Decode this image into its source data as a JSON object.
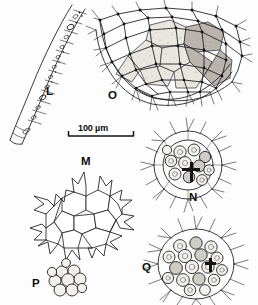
{
  "plate": {
    "title": "Microalgae plate",
    "background_color": "#fdfdfd",
    "ink_color": "#1a1a1a",
    "width": 258,
    "height": 305
  },
  "scale_bar": {
    "label": "100 µm",
    "value": 100,
    "unit": "µm",
    "x": 68,
    "y": 136,
    "length_px": 66
  },
  "figures": [
    {
      "id": "L",
      "label": "L",
      "kind": "filament",
      "description": "curved multicellular filament with segmented cells",
      "label_x": 46,
      "label_y": 86
    },
    {
      "id": "O",
      "label": "O",
      "kind": "net-colony",
      "description": "large reticulate net colony with nodes, spines and shaded cells",
      "label_x": 108,
      "label_y": 90
    },
    {
      "id": "M",
      "label": "M",
      "kind": "plate-colony",
      "description": "flat polygonal cell colony with pointed marginal horns",
      "label_x": 81,
      "label_y": 156
    },
    {
      "id": "N",
      "label": "N",
      "kind": "spherical-colony",
      "description": "spherical colony with rounded internal cells and radiating spines",
      "label_x": 189,
      "label_y": 192
    },
    {
      "id": "P",
      "label": "P",
      "kind": "cell-cluster",
      "description": "small compact cluster of rounded cells",
      "label_x": 32,
      "label_y": 278
    },
    {
      "id": "Q",
      "label": "Q",
      "kind": "spherical-colony",
      "description": "large spherical colony with many rounded internal cells and spines",
      "label_x": 142,
      "label_y": 262
    }
  ]
}
